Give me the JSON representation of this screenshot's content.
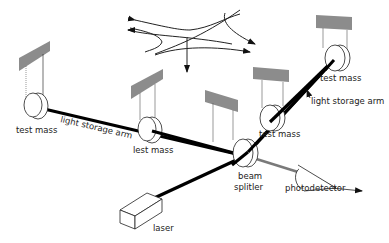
{
  "diagram": {
    "labels": {
      "test_mass_far_left": "test mass",
      "arm_left": "light storage arm",
      "test_mass_near_left": "lest mass",
      "test_mass_near_right": "test mass",
      "test_mass_far_right": "test mass",
      "arm_right": "light storage arm",
      "beam_splitter_line1": "beam",
      "beam_splitter_line2": "splitler",
      "photodetector": "photodetector",
      "laser": "laser"
    },
    "colors": {
      "beam": "#000000",
      "support": "#8c8c8c",
      "output_beam": "#7a7a7a",
      "line": "#222222"
    }
  }
}
